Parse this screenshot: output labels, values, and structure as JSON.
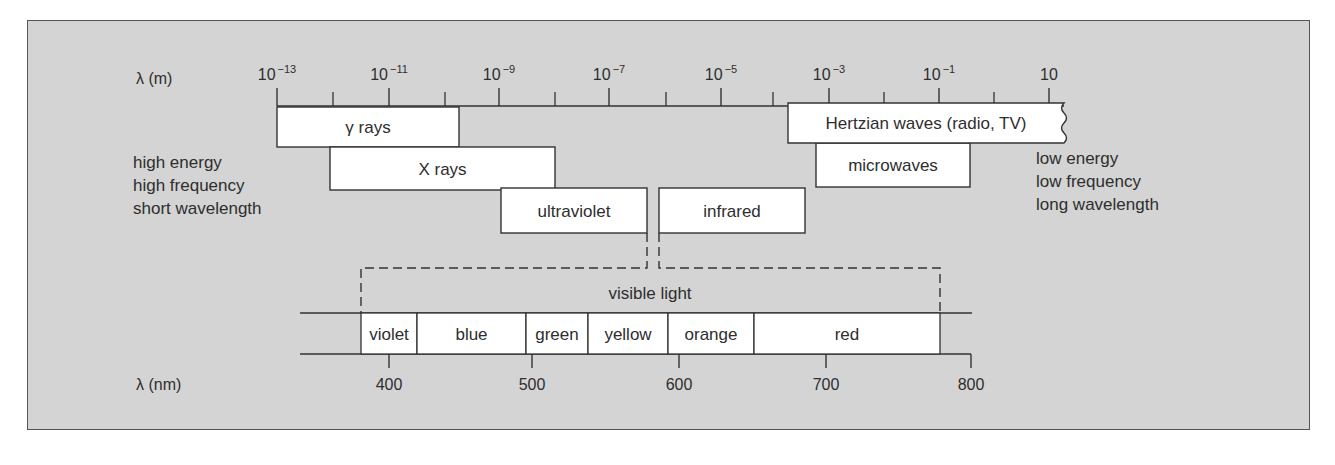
{
  "figure": {
    "colors": {
      "panel": "#d4d4d4",
      "box_fill": "#ffffff",
      "stroke": "#333333",
      "text": "#2e2e2e"
    },
    "top_axis": {
      "label": "λ (m)",
      "ticks": [
        {
          "base": "10",
          "exp": "−13",
          "x": 277
        },
        {
          "base": "10",
          "exp": "−11",
          "x": 389
        },
        {
          "base": "10",
          "exp": "−9",
          "x": 499
        },
        {
          "base": "10",
          "exp": "−7",
          "x": 609
        },
        {
          "base": "10",
          "exp": "−5",
          "x": 721
        },
        {
          "base": "10",
          "exp": "−3",
          "x": 829
        },
        {
          "base": "10",
          "exp": "−1",
          "x": 939
        },
        {
          "base": "10",
          "exp": "",
          "x": 1049
        }
      ],
      "minor_ticks_x": [
        333,
        445,
        555,
        666,
        773,
        884,
        994
      ]
    },
    "bands": [
      {
        "id": "gamma",
        "label": "γ rays",
        "x1": 277,
        "x2": 459,
        "y1": 107,
        "y2": 147
      },
      {
        "id": "xray",
        "label": "X rays",
        "x1": 330,
        "x2": 555,
        "y1": 147,
        "y2": 190
      },
      {
        "id": "ultraviolet",
        "label": "ultraviolet",
        "x1": 501,
        "x2": 647,
        "y1": 188,
        "y2": 233
      },
      {
        "id": "infrared",
        "label": "infrared",
        "x1": 659,
        "x2": 805,
        "y1": 188,
        "y2": 233
      },
      {
        "id": "microwaves",
        "label": "microwaves",
        "x1": 816,
        "x2": 970,
        "y1": 143,
        "y2": 187
      },
      {
        "id": "hertzian",
        "label": "Hertzian waves (radio, TV)",
        "x1": 788,
        "x2": 1064,
        "y1": 103,
        "y2": 143
      }
    ],
    "left_note": [
      "high energy",
      "high frequency",
      "short wavelength"
    ],
    "right_note": [
      "low energy",
      "low frequency",
      "long wavelength"
    ],
    "visible": {
      "label": "visible light",
      "colors": [
        {
          "label": "violet",
          "x1": 361,
          "x2": 417
        },
        {
          "label": "blue",
          "x1": 417,
          "x2": 526
        },
        {
          "label": "green",
          "x1": 526,
          "x2": 588
        },
        {
          "label": "yellow",
          "x1": 588,
          "x2": 668
        },
        {
          "label": "orange",
          "x1": 668,
          "x2": 754
        },
        {
          "label": "red",
          "x1": 754,
          "x2": 940
        }
      ]
    },
    "bottom_axis": {
      "label": "λ (nm)",
      "ticks": [
        {
          "label": "400",
          "x": 389
        },
        {
          "label": "500",
          "x": 532
        },
        {
          "label": "600",
          "x": 679
        },
        {
          "label": "700",
          "x": 826
        },
        {
          "label": "800",
          "x": 971
        }
      ]
    }
  }
}
